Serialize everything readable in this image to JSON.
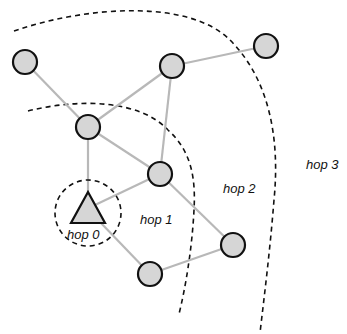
{
  "diagram": {
    "colors": {
      "node_fill": "#d6d6d6",
      "node_stroke": "#111111",
      "edge": "#b8b8b8",
      "boundary": "#111111"
    },
    "labels": {
      "hop0": "hop 0",
      "hop1": "hop 1",
      "hop2": "hop 2",
      "hop3": "hop 3"
    },
    "source_node": {
      "shape": "triangle",
      "label": "hop 0"
    },
    "nodes": [
      {
        "id": "A",
        "x": 25,
        "y": 62
      },
      {
        "id": "B",
        "x": 172,
        "y": 66
      },
      {
        "id": "C",
        "x": 266,
        "y": 46
      },
      {
        "id": "D",
        "x": 88,
        "y": 127
      },
      {
        "id": "E",
        "x": 160,
        "y": 174
      },
      {
        "id": "F",
        "x": 233,
        "y": 245
      },
      {
        "id": "G",
        "x": 150,
        "y": 274
      }
    ],
    "edges": [
      [
        "A",
        "D"
      ],
      [
        "D",
        "B"
      ],
      [
        "B",
        "C"
      ],
      [
        "B",
        "E"
      ],
      [
        "D",
        "E"
      ],
      [
        "S",
        "D"
      ],
      [
        "S",
        "E"
      ],
      [
        "S",
        "G"
      ],
      [
        "G",
        "F"
      ],
      [
        "E",
        "F"
      ]
    ]
  }
}
